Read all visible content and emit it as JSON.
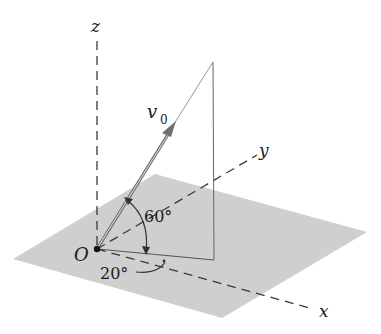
{
  "figure": {
    "type": "3d-vector-diagram"
  },
  "axes": {
    "x_label": "x",
    "y_label": "y",
    "z_label": "z",
    "style": "dashed"
  },
  "origin": {
    "label": "O"
  },
  "vector": {
    "label_main": "v",
    "label_sub": "0",
    "color": "#6e6e6e"
  },
  "angles": {
    "elevation": "60°",
    "azimuth": "20°"
  },
  "colors": {
    "plane_fill": "#cdcdcd",
    "line": "#555555",
    "axis_dash": "#3a3a3a",
    "text": "#1a1a1a"
  }
}
